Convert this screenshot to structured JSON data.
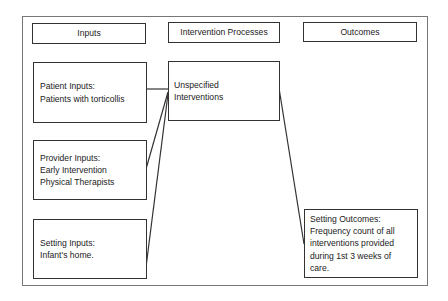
{
  "columns": {
    "inputs": "Inputs",
    "processes": "Intervention Processes",
    "outcomes": "Outcomes"
  },
  "inputs": [
    {
      "title": "Patient Inputs:",
      "lines": [
        "Patients with torticollis"
      ]
    },
    {
      "title": "Provider Inputs:",
      "lines": [
        "Early Intervention",
        "Physical Therapists"
      ]
    },
    {
      "title": "Setting Inputs:",
      "lines": [
        "Infant's home."
      ]
    }
  ],
  "processes": [
    {
      "lines": [
        "Unspecified",
        "Interventions"
      ]
    }
  ],
  "outcomes": [
    {
      "title": "Setting Outcomes:",
      "lines": [
        "Frequency count of all",
        "interventions provided",
        "during 1st 3 weeks of",
        "care."
      ]
    }
  ],
  "connections": [
    {
      "from": "patient-inputs",
      "to": "unspecified-interventions"
    },
    {
      "from": "provider-inputs",
      "to": "unspecified-interventions"
    },
    {
      "from": "setting-inputs",
      "to": "unspecified-interventions"
    },
    {
      "from": "unspecified-interventions",
      "to": "setting-outcomes"
    }
  ]
}
